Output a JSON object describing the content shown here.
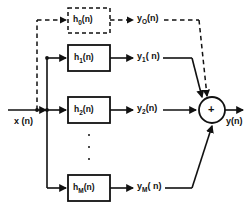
{
  "diagram": {
    "input": {
      "label": "x (n)"
    },
    "output": {
      "label": "y(n)"
    },
    "adder": {
      "symbol": "+",
      "name": "summing-junction"
    },
    "ellipsis": {
      "dots": 3
    },
    "colors": {
      "stroke": "#111111",
      "background": "#ffffff",
      "text": "#111111"
    },
    "branches": [
      {
        "id": "branch-0",
        "filter_label_base": "h",
        "filter_subscript": "0",
        "filter_label_suffix": "(n)",
        "filter_full": "h0(n)",
        "signal_label_base": "y",
        "signal_subscript": "O",
        "signal_label_suffix": "(n)",
        "signal_full": "y0(n)",
        "style": "dashed"
      },
      {
        "id": "branch-1",
        "filter_label_base": "h",
        "filter_subscript": "1",
        "filter_label_suffix": "(n)",
        "filter_full": "h1(n)",
        "signal_label_base": "y",
        "signal_subscript": "1",
        "signal_label_suffix": "( n)",
        "signal_full": "y1( n)",
        "style": "solid"
      },
      {
        "id": "branch-2",
        "filter_label_base": "h",
        "filter_subscript": "2",
        "filter_label_suffix": "(n)",
        "filter_full": "h2(n)",
        "signal_label_base": "y",
        "signal_subscript": "2",
        "signal_label_suffix": "(n)",
        "signal_full": "y2(n)",
        "style": "solid"
      },
      {
        "id": "branch-m",
        "filter_label_base": "h",
        "filter_subscript": "M",
        "filter_label_suffix": "(n)",
        "filter_full": "hM(n)",
        "signal_label_base": "y",
        "signal_subscript": "M",
        "signal_label_suffix": "( n)",
        "signal_full": "yM( n)",
        "style": "solid"
      }
    ]
  }
}
